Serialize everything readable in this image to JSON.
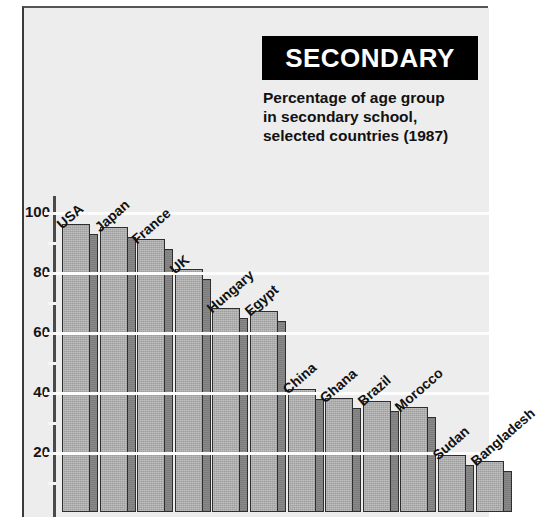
{
  "header": {
    "banner_title": "SECONDARY",
    "subtitle_lines": [
      "Percentage of age group",
      "in secondary school,",
      "selected countries (1987)"
    ]
  },
  "colors": {
    "banner_bg": "#000000",
    "banner_text": "#ffffff",
    "page_bg": "#ededed",
    "bar_face": "#9d9d9d",
    "bar_side": "#8a8a8a",
    "bar_outline": "#2e2e2e",
    "gridline": "#fdfdfd",
    "axis": "#4a4a4a",
    "text": "#121212"
  },
  "axis": {
    "tick_labels": [
      "100",
      "80",
      "60",
      "40",
      "20"
    ],
    "tick_values": [
      100,
      80,
      60,
      40,
      20
    ],
    "minor_tick_values": [
      90,
      70,
      50,
      30,
      10
    ]
  },
  "chart_data": {
    "type": "bar",
    "title": "SECONDARY",
    "subtitle": "Percentage of age group in secondary school, selected countries (1987)",
    "xlabel": "",
    "ylabel": "",
    "ylim": [
      0,
      105
    ],
    "grid": true,
    "legend": "none",
    "categories": [
      "USA",
      "Japan",
      "France",
      "UK",
      "Hungary",
      "Egypt",
      "China",
      "Ghana",
      "Brazil",
      "Morocco",
      "Sudan",
      "Bangladesh"
    ],
    "values": [
      96,
      95,
      91,
      81,
      68,
      67,
      41,
      38,
      37,
      35,
      19,
      17
    ],
    "series": [
      {
        "name": "Percentage of age group in secondary school (1987)",
        "values": [
          96,
          95,
          91,
          81,
          68,
          67,
          41,
          38,
          37,
          35,
          19,
          17
        ]
      }
    ]
  }
}
